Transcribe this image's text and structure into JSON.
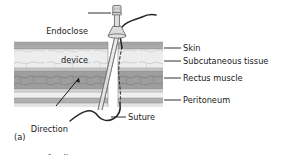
{
  "figure": {
    "caption": "(a)",
    "domain_note": "medical illustration, abdominal wall cross-section with Endoclose suture passer"
  },
  "labels": {
    "endoclose": "Endoclose\ndevice",
    "endoclose_line1": "Endoclose",
    "endoclose_line2": "device",
    "direction_line1": "Direction",
    "direction_line2": "of pull",
    "suture": "Suture",
    "skin": "Skin",
    "subcutaneous": "Subcutaneous tissue",
    "rectus": "Rectus muscle",
    "peritoneum": "Peritoneum"
  },
  "layers": [
    {
      "name": "skin",
      "label": "Skin",
      "y": 42.0,
      "h": 7.0,
      "color": "#a8a8a8"
    },
    {
      "name": "subcutaneous-tissue",
      "label": "Subcutaneous tissue",
      "y": 49.0,
      "h": 19.0,
      "color": "#ededed"
    },
    {
      "name": "fascia-upper",
      "label": "",
      "y": 68.0,
      "h": 3.0,
      "color": "#c6c6c6"
    },
    {
      "name": "rectus-muscle",
      "label": "Rectus muscle",
      "y": 71.0,
      "h": 18.0,
      "color": "#9e9e9e"
    },
    {
      "name": "fascia-lower",
      "label": "",
      "y": 89.0,
      "h": 3.0,
      "color": "#d8d8d8"
    },
    {
      "name": "sub-band",
      "label": "",
      "y": 92.0,
      "h": 6.0,
      "color": "#efefef"
    },
    {
      "name": "peritoneum",
      "label": "Peritoneum",
      "y": 98.0,
      "h": 5.0,
      "color": "#b0b0b0"
    },
    {
      "name": "cavity",
      "label": "",
      "y": 103.0,
      "h": 4.0,
      "color": "#e4e4e4"
    }
  ],
  "leaders": [
    {
      "name": "skin",
      "y": 48.0,
      "x_start": 164,
      "x_end": 181
    },
    {
      "name": "subcutaneous-tissue",
      "y": 61.0,
      "x_start": 164,
      "x_end": 181
    },
    {
      "name": "rectus-muscle",
      "y": 78.0,
      "x_start": 164,
      "x_end": 181
    },
    {
      "name": "peritoneum",
      "y": 100.0,
      "x_start": 164,
      "x_end": 181
    }
  ],
  "label_positions": {
    "skin": {
      "x": 183,
      "y": 43.5
    },
    "subcutaneous": {
      "x": 183,
      "y": 56.5
    },
    "rectus": {
      "x": 183,
      "y": 73.5
    },
    "peritoneum": {
      "x": 183,
      "y": 95.5
    },
    "endoclose": {
      "x": 38,
      "y": 8
    },
    "direction": {
      "x": 27,
      "y": 108
    },
    "suture": {
      "x": 128,
      "y": 113
    },
    "caption": {
      "x": 14,
      "y": 136
    }
  },
  "colors": {
    "ink": "#1a1a1a",
    "outline": "#6e6e6e",
    "suture": "#2a2a2a",
    "device_body": "#dcdcdc",
    "device_edge": "#6b6b6b",
    "background": "#ffffff"
  },
  "geometry": {
    "tissue_left": 14,
    "tissue_right": 163,
    "incision_gap_left": 108,
    "incision_gap_right": 118,
    "needle_top_x": 116,
    "needle_bottom_x": 99,
    "device_center_x": 117
  }
}
